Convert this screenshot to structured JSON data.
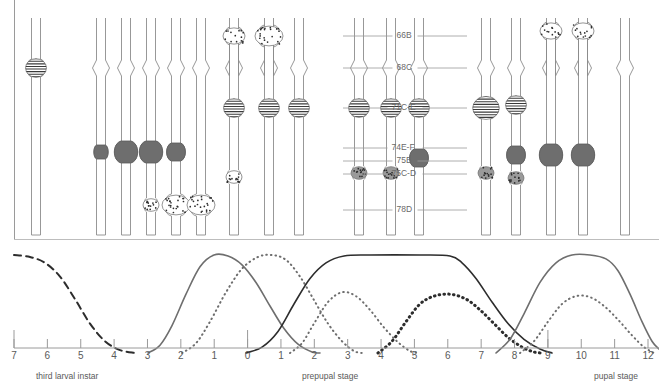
{
  "figure": {
    "type": "puff-stage-diagram",
    "title_visible": false
  },
  "chromosome_panel": {
    "columns": [
      {
        "index": 0,
        "x": 36,
        "group": "pre",
        "constriction": false,
        "features": [
          {
            "band": "71C-E",
            "style": "striped",
            "size": "medium",
            "y": 68
          }
        ]
      },
      {
        "index": 1,
        "x": 101,
        "group": "A",
        "constriction": true,
        "features": [
          {
            "band": "74E-F/75B",
            "style": "dark-puff",
            "size": "small",
            "y": 152
          }
        ]
      },
      {
        "index": 2,
        "x": 126,
        "group": "A",
        "constriction": true,
        "features": [
          {
            "band": "74E-F/75B",
            "style": "dark-puff",
            "size": "large",
            "y": 152
          }
        ]
      },
      {
        "index": 3,
        "x": 151,
        "group": "A",
        "constriction": true,
        "features": [
          {
            "band": "74E-F/75B",
            "style": "dark-puff",
            "size": "large",
            "y": 152
          },
          {
            "band": "75C-D",
            "style": "stipple-puff",
            "size": "small",
            "y": 205
          }
        ]
      },
      {
        "index": 4,
        "x": 176,
        "group": "A",
        "constriction": true,
        "features": [
          {
            "band": "74E-F/75B",
            "style": "dark-puff",
            "size": "medium",
            "y": 152
          },
          {
            "band": "75C-D",
            "style": "stipple-puff",
            "size": "large",
            "y": 205
          }
        ]
      },
      {
        "index": 5,
        "x": 201,
        "group": "A",
        "constriction": true,
        "features": [
          {
            "band": "75C-D",
            "style": "stipple-puff",
            "size": "large",
            "y": 205
          }
        ]
      },
      {
        "index": 6,
        "x": 234,
        "group": "B",
        "constriction": true,
        "features": [
          {
            "band": "66B",
            "style": "stipple-puff",
            "size": "medium",
            "y": 36
          },
          {
            "band": "71C-E",
            "style": "striped",
            "size": "medium",
            "y": 108
          },
          {
            "band": "75C-D",
            "style": "stipple-puff",
            "size": "small",
            "y": 177
          }
        ]
      },
      {
        "index": 7,
        "x": 269,
        "group": "B",
        "constriction": true,
        "features": [
          {
            "band": "66B",
            "style": "stipple-puff",
            "size": "large",
            "y": 36
          },
          {
            "band": "71C-E",
            "style": "striped",
            "size": "medium",
            "y": 108
          }
        ]
      },
      {
        "index": 8,
        "x": 299,
        "group": "B",
        "constriction": true,
        "features": [
          {
            "band": "71C-E",
            "style": "striped",
            "size": "medium",
            "y": 108
          }
        ]
      },
      {
        "index": 9,
        "x": 359,
        "group": "C",
        "constriction": true,
        "features": [
          {
            "band": "71C-E",
            "style": "striped",
            "size": "medium",
            "y": 108
          },
          {
            "band": "75C-D",
            "style": "stipple-dark",
            "size": "small",
            "y": 173
          }
        ]
      },
      {
        "index": 10,
        "x": 391,
        "group": "C",
        "constriction": true,
        "features": [
          {
            "band": "71C-E",
            "style": "striped",
            "size": "medium",
            "y": 108
          },
          {
            "band": "75C-D",
            "style": "stipple-dark",
            "size": "small",
            "y": 173
          }
        ]
      },
      {
        "index": 11,
        "x": 419,
        "group": "C",
        "constriction": true,
        "features": [
          {
            "band": "71C-E",
            "style": "striped",
            "size": "medium",
            "y": 108
          },
          {
            "band": "74E-F/75B",
            "style": "dark-puff",
            "size": "medium",
            "y": 158
          }
        ]
      },
      {
        "index": 12,
        "x": 486,
        "group": "D",
        "constriction": true,
        "features": [
          {
            "band": "71C-E",
            "style": "striped",
            "size": "large",
            "y": 108
          },
          {
            "band": "75C-D",
            "style": "stipple-dark",
            "size": "small",
            "y": 173
          }
        ]
      },
      {
        "index": 13,
        "x": 516,
        "group": "D",
        "constriction": true,
        "features": [
          {
            "band": "71C-E",
            "style": "striped",
            "size": "medium",
            "y": 105
          },
          {
            "band": "74E-F/75B",
            "style": "dark-puff",
            "size": "medium",
            "y": 155
          },
          {
            "band": "75C-D",
            "style": "stipple-dark",
            "size": "small",
            "y": 178
          }
        ]
      },
      {
        "index": 14,
        "x": 551,
        "group": "D",
        "constriction": true,
        "features": [
          {
            "band": "66B",
            "style": "stipple-puff",
            "size": "medium",
            "y": 31
          },
          {
            "band": "74E-F/75B",
            "style": "dark-puff",
            "size": "large",
            "y": 155
          }
        ]
      },
      {
        "index": 15,
        "x": 583,
        "group": "D",
        "constriction": true,
        "features": [
          {
            "band": "66B",
            "style": "stipple-puff",
            "size": "medium",
            "y": 31
          },
          {
            "band": "74E-F/75B",
            "style": "dark-puff",
            "size": "large",
            "y": 155
          }
        ]
      },
      {
        "index": 16,
        "x": 625,
        "group": "D",
        "constriction": true,
        "features": []
      }
    ],
    "band_labels": [
      {
        "text": "66B",
        "y": 36,
        "leader_left": 343,
        "leader_right": 467
      },
      {
        "text": "68C",
        "y": 68,
        "leader_left": 343,
        "leader_right": 467
      },
      {
        "text": "71C-E",
        "y": 108,
        "leader_left": 343,
        "leader_right": 467
      },
      {
        "text": "74E-F",
        "y": 148,
        "leader_left": 343,
        "leader_right": 467
      },
      {
        "text": "75B",
        "y": 161,
        "leader_left": 343,
        "leader_right": 467
      },
      {
        "text": "75C-D",
        "y": 174,
        "leader_left": 343,
        "leader_right": 467
      },
      {
        "text": "78D",
        "y": 210,
        "leader_left": 343,
        "leader_right": 467
      }
    ]
  },
  "chart_data": {
    "type": "line",
    "title": "",
    "xlabel": "",
    "ylabel": "",
    "grid": false,
    "legend": "none",
    "axis": {
      "tick_labels": [
        "7",
        "6",
        "5",
        "4",
        "3",
        "2",
        "1",
        "0",
        "1",
        "2",
        "3",
        "4",
        "5",
        "6",
        "7",
        "8",
        "9",
        "10",
        "11",
        "12"
      ],
      "tick_positions_px": [
        14,
        53,
        91,
        130,
        168,
        207,
        245,
        284,
        322,
        361,
        399,
        438,
        476,
        515,
        553,
        592,
        630,
        669,
        707,
        746
      ],
      "x_min_label": "7",
      "x_max_label": "12"
    },
    "stage_labels": [
      {
        "text": "third larval instar",
        "x": 36,
        "y": 371
      },
      {
        "text": "prepupal stage",
        "x": 302,
        "y": 371
      },
      {
        "text": "pupal stage",
        "x": 594,
        "y": 371
      }
    ],
    "series": [
      {
        "name": "intermolt puffs",
        "style": "dashed",
        "color": "#2d2d2d",
        "points": [
          [
            14,
            1.0
          ],
          [
            30,
            0.98
          ],
          [
            45,
            0.92
          ],
          [
            60,
            0.78
          ],
          [
            75,
            0.55
          ],
          [
            90,
            0.3
          ],
          [
            105,
            0.12
          ],
          [
            120,
            0.03
          ],
          [
            135,
            0.0
          ]
        ]
      },
      {
        "name": "early puffs (74E-F, 75B)",
        "style": "solid",
        "color": "#6e6e6e",
        "points": [
          [
            148,
            0.0
          ],
          [
            160,
            0.08
          ],
          [
            172,
            0.28
          ],
          [
            186,
            0.6
          ],
          [
            200,
            0.88
          ],
          [
            214,
            1.0
          ],
          [
            228,
            0.99
          ],
          [
            242,
            0.9
          ],
          [
            256,
            0.72
          ],
          [
            270,
            0.48
          ],
          [
            284,
            0.25
          ],
          [
            298,
            0.09
          ],
          [
            312,
            0.01
          ],
          [
            320,
            0.0
          ]
        ]
      },
      {
        "name": "early-late puffs (63F, 78D)",
        "style": "dotted",
        "color": "#6e6e6e",
        "points": [
          [
            182,
            0.0
          ],
          [
            196,
            0.1
          ],
          [
            210,
            0.32
          ],
          [
            226,
            0.62
          ],
          [
            242,
            0.86
          ],
          [
            258,
            0.98
          ],
          [
            272,
            1.0
          ],
          [
            286,
            0.95
          ],
          [
            300,
            0.78
          ],
          [
            314,
            0.54
          ],
          [
            328,
            0.3
          ],
          [
            342,
            0.12
          ],
          [
            354,
            0.02
          ],
          [
            362,
            0.0
          ]
        ]
      },
      {
        "name": "late puffs (62E, 82F)",
        "style": "solid",
        "color": "#2d2d2d",
        "points": [
          [
            246,
            0.0
          ],
          [
            262,
            0.06
          ],
          [
            278,
            0.22
          ],
          [
            294,
            0.5
          ],
          [
            310,
            0.76
          ],
          [
            326,
            0.92
          ],
          [
            344,
            0.99
          ],
          [
            370,
            1.0
          ],
          [
            420,
            1.0
          ],
          [
            450,
            0.99
          ],
          [
            462,
            0.92
          ],
          [
            476,
            0.76
          ],
          [
            492,
            0.52
          ],
          [
            508,
            0.3
          ],
          [
            524,
            0.14
          ],
          [
            540,
            0.04
          ],
          [
            552,
            0.0
          ]
        ]
      },
      {
        "name": "prepupal puff set",
        "style": "dotted",
        "color": "#6e6e6e",
        "points": [
          [
            290,
            0.0
          ],
          [
            302,
            0.1
          ],
          [
            314,
            0.3
          ],
          [
            328,
            0.52
          ],
          [
            342,
            0.62
          ],
          [
            356,
            0.58
          ],
          [
            370,
            0.44
          ],
          [
            384,
            0.26
          ],
          [
            398,
            0.11
          ],
          [
            410,
            0.02
          ],
          [
            418,
            0.0
          ]
        ]
      },
      {
        "name": "mid-prepupal puffs",
        "style": "thick-dotted",
        "color": "#2d2d2d",
        "points": [
          [
            378,
            0.0
          ],
          [
            392,
            0.12
          ],
          [
            406,
            0.32
          ],
          [
            420,
            0.5
          ],
          [
            434,
            0.58
          ],
          [
            450,
            0.6
          ],
          [
            466,
            0.55
          ],
          [
            480,
            0.44
          ],
          [
            494,
            0.3
          ],
          [
            508,
            0.16
          ],
          [
            522,
            0.06
          ],
          [
            534,
            0.01
          ],
          [
            542,
            0.0
          ]
        ]
      },
      {
        "name": "pupal puffs",
        "style": "solid",
        "color": "#6e6e6e",
        "points": [
          [
            496,
            0.0
          ],
          [
            510,
            0.14
          ],
          [
            524,
            0.4
          ],
          [
            540,
            0.72
          ],
          [
            556,
            0.92
          ],
          [
            572,
            1.0
          ],
          [
            590,
            1.0
          ],
          [
            606,
            0.96
          ],
          [
            618,
            0.84
          ],
          [
            630,
            0.6
          ],
          [
            642,
            0.32
          ],
          [
            652,
            0.12
          ],
          [
            659,
            0.04
          ]
        ]
      },
      {
        "name": "late pupal puffs",
        "style": "dotted",
        "color": "#6e6e6e",
        "points": [
          [
            520,
            0.0
          ],
          [
            534,
            0.12
          ],
          [
            548,
            0.32
          ],
          [
            562,
            0.5
          ],
          [
            576,
            0.58
          ],
          [
            590,
            0.57
          ],
          [
            604,
            0.48
          ],
          [
            618,
            0.34
          ],
          [
            632,
            0.18
          ],
          [
            644,
            0.06
          ],
          [
            654,
            0.0
          ]
        ]
      }
    ]
  }
}
